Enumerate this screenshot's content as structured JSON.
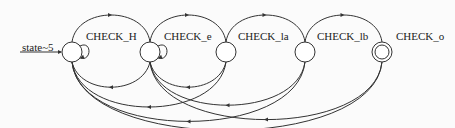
{
  "diagram": {
    "type": "state-machine",
    "initial_label": "state~5",
    "states": [
      {
        "id": "s0",
        "label": "CHECK_H",
        "accepting": false
      },
      {
        "id": "s1",
        "label": "CHECK_e",
        "accepting": false
      },
      {
        "id": "s2",
        "label": "CHECK_la",
        "accepting": false
      },
      {
        "id": "s3",
        "label": "CHECK_lb",
        "accepting": false
      },
      {
        "id": "s4",
        "label": "CHECK_o",
        "accepting": true
      }
    ],
    "transitions": [
      {
        "from": "s0",
        "to": "s1"
      },
      {
        "from": "s1",
        "to": "s2"
      },
      {
        "from": "s2",
        "to": "s3"
      },
      {
        "from": "s3",
        "to": "s4"
      },
      {
        "from": "s0",
        "to": "s0"
      },
      {
        "from": "s1",
        "to": "s1"
      },
      {
        "from": "s1",
        "to": "s0"
      },
      {
        "from": "s2",
        "to": "s0"
      },
      {
        "from": "s3",
        "to": "s0"
      },
      {
        "from": "s4",
        "to": "s0"
      },
      {
        "from": "s2",
        "to": "s1"
      },
      {
        "from": "s3",
        "to": "s1"
      },
      {
        "from": "s4",
        "to": "s1"
      }
    ]
  }
}
